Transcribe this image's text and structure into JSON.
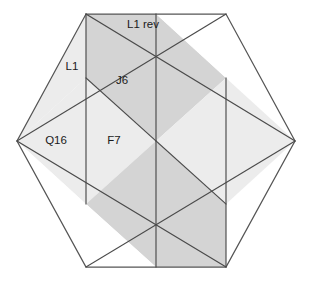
{
  "diagram": {
    "type": "hexagon-rhombus-tiling",
    "canvas": {
      "width": 311,
      "height": 282,
      "background": "#ffffff"
    },
    "colors": {
      "stroke": "#4a4a4a",
      "fill_dark": "#d4d4d4",
      "fill_light": "#ececec",
      "fill_white": "#ffffff",
      "text": "#1a1a1a"
    },
    "hexagon": {
      "center": {
        "x": 156,
        "y": 141
      },
      "vertices": [
        {
          "name": "top-left",
          "x": 86,
          "y": 14
        },
        {
          "name": "top-right",
          "x": 226,
          "y": 14
        },
        {
          "name": "right",
          "x": 295,
          "y": 141
        },
        {
          "name": "bottom-right",
          "x": 226,
          "y": 267
        },
        {
          "name": "bottom-left",
          "x": 86,
          "y": 267
        },
        {
          "name": "left",
          "x": 17,
          "y": 141
        }
      ]
    },
    "labels": [
      {
        "id": "l1-rev",
        "text": "L1 rev",
        "x": 143,
        "y": 25,
        "anchor": "middle"
      },
      {
        "id": "l1",
        "text": "L1",
        "x": 72,
        "y": 67,
        "anchor": "middle"
      },
      {
        "id": "j6",
        "text": "J6",
        "x": 122,
        "y": 81,
        "anchor": "middle"
      },
      {
        "id": "q16",
        "text": "Q16",
        "x": 56,
        "y": 141,
        "anchor": "middle"
      },
      {
        "id": "f7",
        "text": "F7",
        "x": 114,
        "y": 141,
        "anchor": "middle"
      }
    ],
    "regions": [
      {
        "id": "j6-rhombus",
        "label": "J6",
        "shade": "dark"
      },
      {
        "id": "bottom-right-rhombus",
        "label": "",
        "shade": "dark"
      },
      {
        "id": "l1-strip",
        "label": "L1",
        "shade": "light"
      },
      {
        "id": "q16-region",
        "label": "Q16",
        "shade": "light"
      },
      {
        "id": "f7-region",
        "label": "F7",
        "shade": "light"
      },
      {
        "id": "upper-right-region",
        "label": "",
        "shade": "white"
      },
      {
        "id": "right-region",
        "label": "",
        "shade": "light"
      },
      {
        "id": "lower-left-region",
        "label": "",
        "shade": "white"
      },
      {
        "id": "bottom-strip",
        "label": "",
        "shade": "light"
      },
      {
        "id": "l1-rev-strip",
        "label": "L1 rev",
        "shade": "white"
      }
    ]
  }
}
